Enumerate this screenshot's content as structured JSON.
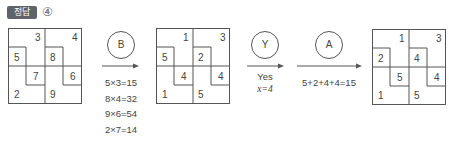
{
  "header": {
    "badge_label": "정답",
    "answer": "④"
  },
  "grids": [
    {
      "id": "initial",
      "cells": {
        "tl_L": "3",
        "tl_sq": "5",
        "tr_L": "4",
        "tr_sq": "8",
        "bl_sq": "7",
        "bl_L": "2",
        "br_sq": "6",
        "br_L": "9"
      }
    },
    {
      "id": "after_B",
      "cells": {
        "tl_L": "1",
        "tl_sq": "5",
        "tr_L": "3",
        "tr_sq": "2",
        "bl_sq": "4",
        "bl_L": "1",
        "br_sq": "4",
        "br_L": "5"
      }
    },
    {
      "id": "final",
      "cells": {
        "tl_L": "1",
        "tl_sq": "2",
        "tr_L": "3",
        "tr_sq": "4",
        "bl_sq": "5",
        "bl_L": "1",
        "br_sq": "4",
        "br_L": "5"
      }
    }
  ],
  "steps": [
    {
      "label": "B",
      "notes": [
        "5×3=15",
        "8×4=32",
        "9×6=54",
        "2×7=14"
      ]
    },
    {
      "label": "Y",
      "notes": [
        "Yes",
        "x=4"
      ]
    },
    {
      "label": "A",
      "notes": [
        "5+2+4+4=15"
      ]
    }
  ],
  "colors": {
    "line": "#555555",
    "badge_bg": "#5f6266",
    "text": "#444444"
  }
}
